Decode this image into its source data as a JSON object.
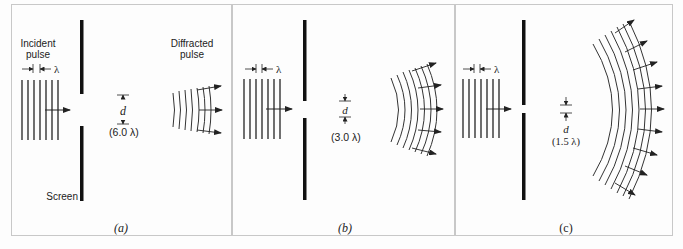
{
  "figure": {
    "panels": [
      {
        "id": "a",
        "caption": "(a)",
        "incident_label_line1": "Incident",
        "incident_label_line2": "pulse",
        "diffracted_label_line1": "Diffracted",
        "diffracted_label_line2": "pulse",
        "screen_label": "Screen",
        "wavelength_symbol": "λ",
        "gap_symbol": "d",
        "gap_value": "(6.0 λ)"
      },
      {
        "id": "b",
        "caption": "(b)",
        "wavelength_symbol": "λ",
        "gap_symbol": "d",
        "gap_value": "(3.0 λ)"
      },
      {
        "id": "c",
        "caption": "(c)",
        "wavelength_symbol": "λ",
        "gap_symbol": "d",
        "gap_value": "(1.5 λ)"
      }
    ],
    "colors": {
      "ink": "#222222",
      "border": "#c8c8c8",
      "background": "#fdfdfd"
    }
  }
}
